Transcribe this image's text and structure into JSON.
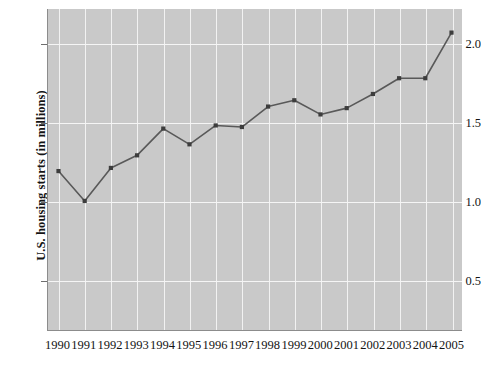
{
  "chart_data": {
    "type": "line",
    "title": "",
    "subtitle": "",
    "xlabel": "",
    "ylabel": "U.S. housing starts (in millions)",
    "categories": [
      "1990",
      "1991",
      "1992",
      "1993",
      "1994",
      "1995",
      "1996",
      "1997",
      "1998",
      "1999",
      "2000",
      "2001",
      "2002",
      "2003",
      "2004",
      "2005"
    ],
    "x": [
      1990,
      1991,
      1992,
      1993,
      1994,
      1995,
      1996,
      1997,
      1998,
      1999,
      2000,
      2001,
      2002,
      2003,
      2004,
      2005
    ],
    "values": [
      1.19,
      1.0,
      1.21,
      1.29,
      1.46,
      1.36,
      1.48,
      1.47,
      1.6,
      1.64,
      1.55,
      1.59,
      1.68,
      1.78,
      1.78,
      2.07
    ],
    "series": [
      {
        "name": "U.S. housing starts",
        "values": [
          1.19,
          1.0,
          1.21,
          1.29,
          1.46,
          1.36,
          1.48,
          1.47,
          1.6,
          1.64,
          1.55,
          1.59,
          1.68,
          1.78,
          1.78,
          2.07
        ]
      }
    ],
    "ylim": [
      0.18,
      2.22
    ],
    "xlim": [
      1989.6,
      2005.4
    ],
    "yticks": [
      0.5,
      1.0,
      1.5,
      2.0
    ],
    "ytick_labels": [
      "0.5",
      "1.0",
      "1.5",
      "2.0"
    ],
    "xticks": [
      1990,
      1991,
      1992,
      1993,
      1994,
      1995,
      1996,
      1997,
      1998,
      1999,
      2000,
      2001,
      2002,
      2003,
      2004,
      2005
    ],
    "grid": true,
    "grid_color": "#f2f2f2",
    "legend": false,
    "legend_position": "none",
    "plot_bgcolor": "#c9c9c9",
    "line_color": "#595959",
    "marker_color": "#3d3d3d",
    "axis_color": "#8c8c8c",
    "text_color": "#141414",
    "annotations": []
  }
}
